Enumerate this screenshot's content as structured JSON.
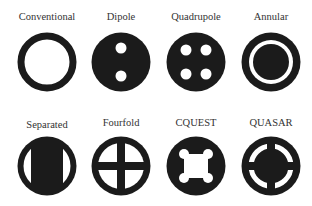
{
  "colors": {
    "fill": "#1b1b1b",
    "background": "#ffffff",
    "label": "#333333"
  },
  "rows": [
    {
      "items": [
        {
          "label": "Conventional",
          "shape": "conventional-ring"
        },
        {
          "label": "Dipole",
          "shape": "dipole"
        },
        {
          "label": "Quadrupole",
          "shape": "quadrupole"
        },
        {
          "label": "Annular",
          "shape": "annular"
        }
      ]
    },
    {
      "items": [
        {
          "label": "Separated",
          "shape": "separated"
        },
        {
          "label": "Fourfold",
          "shape": "fourfold"
        },
        {
          "label": "CQUEST",
          "shape": "cquest"
        },
        {
          "label": "QUASAR",
          "shape": "quasar"
        }
      ]
    }
  ]
}
